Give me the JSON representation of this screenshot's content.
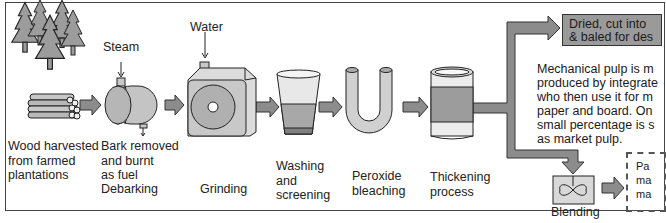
{
  "diagram": {
    "input_labels": {
      "steam": "Steam",
      "water": "Water"
    },
    "stages": [
      {
        "id": "harvest",
        "label": "Wood harvested\nfrom farmed\nplantations",
        "icon": "trees-and-logs-icon"
      },
      {
        "id": "debarking",
        "label": "Bark removed\nand burnt\nas fuel",
        "sublabel": "Debarking",
        "icon": "debarking-drum-icon"
      },
      {
        "id": "grinding",
        "label": "Grinding",
        "icon": "grinder-icon"
      },
      {
        "id": "washing",
        "label": "Washing\nand\nscreening",
        "icon": "washing-vessel-icon"
      },
      {
        "id": "bleaching",
        "label": "Peroxide\nbleaching",
        "icon": "u-tube-icon"
      },
      {
        "id": "thickening",
        "label": "Thickening\nprocess",
        "icon": "thickening-tank-icon"
      },
      {
        "id": "blending",
        "label": "Blending",
        "icon": "blender-mixer-icon"
      }
    ],
    "outputs": {
      "dried": "Dried, cut into\n& baled for des",
      "paper_box": "Pa\nma\nma"
    },
    "note": "Mechanical pulp is m\nproduced by integrate\nwho then use it for m\npaper and board. On\nsmall percentage is s\nas market pulp.",
    "colors": {
      "arrow_fill": "#8c8c8c",
      "arrow_stroke": "#333333",
      "output_box": "#9a9a9a",
      "icon_light": "#d6d6d6",
      "icon_mid": "#a8a8a8",
      "icon_dark": "#7a7a7a"
    }
  }
}
